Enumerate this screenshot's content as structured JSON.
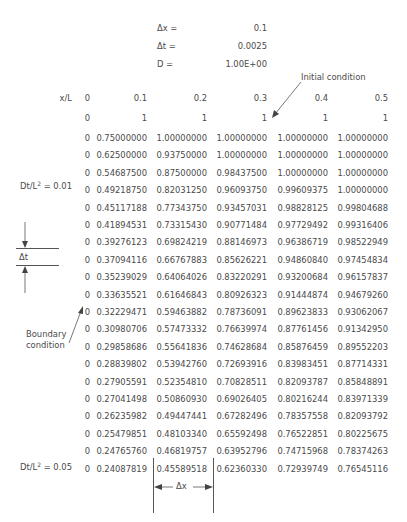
{
  "params": [
    {
      "label": "Δx =",
      "value": "0.1"
    },
    {
      "label": "Δt =",
      "value": "0.0025"
    },
    {
      "label": "D =",
      "value": "1.00E+00"
    }
  ],
  "annotations": {
    "initial_condition": "Initial condition",
    "boundary_condition_line1": "Boundary",
    "boundary_condition_line2": "condition",
    "delta_t": "Δt",
    "delta_x": "Δx",
    "dt_label_1_prefix": "Dt/L",
    "dt_label_1_sup": "2",
    "dt_label_1_suffix": " = 0.01",
    "dt_label_2_prefix": "Dt/L",
    "dt_label_2_sup": "2",
    "dt_label_2_suffix": " = 0.05"
  },
  "table": {
    "header_label": "x/L",
    "columns": [
      "0",
      "0.1",
      "0.2",
      "0.3",
      "0.4",
      "0.5"
    ],
    "initial_row": [
      "0",
      "1",
      "1",
      "1",
      "1",
      "1"
    ],
    "rows": [
      [
        "0",
        "0.75000000",
        "1.00000000",
        "1.00000000",
        "1.00000000",
        "1.00000000"
      ],
      [
        "0",
        "0.62500000",
        "0.93750000",
        "1.00000000",
        "1.00000000",
        "1.00000000"
      ],
      [
        "0",
        "0.54687500",
        "0.87500000",
        "0.98437500",
        "1.00000000",
        "1.00000000"
      ],
      [
        "0",
        "0.49218750",
        "0.82031250",
        "0.96093750",
        "0.99609375",
        "1.00000000"
      ],
      [
        "0",
        "0.45117188",
        "0.77343750",
        "0.93457031",
        "0.98828125",
        "0.99804688"
      ],
      [
        "0",
        "0.41894531",
        "0.73315430",
        "0.90771484",
        "0.97729492",
        "0.99316406"
      ],
      [
        "0",
        "0.39276123",
        "0.69824219",
        "0.88146973",
        "0.96386719",
        "0.98522949"
      ],
      [
        "0",
        "0.37094116",
        "0.66767883",
        "0.85626221",
        "0.94860840",
        "0.97454834"
      ],
      [
        "0",
        "0.35239029",
        "0.64064026",
        "0.83220291",
        "0.93200684",
        "0.96157837"
      ],
      [
        "0",
        "0.33635521",
        "0.61646843",
        "0.80926323",
        "0.91444874",
        "0.94679260"
      ],
      [
        "0",
        "0.32229471",
        "0.59463882",
        "0.78736091",
        "0.89623833",
        "0.93062067"
      ],
      [
        "0",
        "0.30980706",
        "0.57473332",
        "0.76639974",
        "0.87761456",
        "0.91342950"
      ],
      [
        "0",
        "0.29858686",
        "0.55641836",
        "0.74628684",
        "0.85876459",
        "0.89552203"
      ],
      [
        "0",
        "0.28839802",
        "0.53942760",
        "0.72693916",
        "0.83983451",
        "0.87714331"
      ],
      [
        "0",
        "0.27905591",
        "0.52354810",
        "0.70828511",
        "0.82093787",
        "0.85848891"
      ],
      [
        "0",
        "0.27041498",
        "0.50860930",
        "0.69026405",
        "0.80216244",
        "0.83971339"
      ],
      [
        "0",
        "0.26235982",
        "0.49447441",
        "0.67282496",
        "0.78357558",
        "0.82093792"
      ],
      [
        "0",
        "0.25479851",
        "0.48103340",
        "0.65592498",
        "0.76522851",
        "0.80225675"
      ],
      [
        "0",
        "0.24765760",
        "0.46819757",
        "0.63952796",
        "0.74715968",
        "0.78374263"
      ],
      [
        "0",
        "0.24087819",
        "0.45589518",
        "0.62360330",
        "0.72939749",
        "0.76545116"
      ]
    ]
  },
  "chart_data": {
    "type": "table",
    "parameters": {
      "dx": 0.1,
      "dt": 0.0025,
      "D": 1.0
    },
    "columns": [
      "x/L",
      "0",
      "0.1",
      "0.2",
      "0.3",
      "0.4",
      "0.5"
    ],
    "annotations": [
      "Initial condition",
      "Boundary condition",
      "Δt",
      "Δx",
      "Dt/L² = 0.01",
      "Dt/L² = 0.05"
    ]
  }
}
